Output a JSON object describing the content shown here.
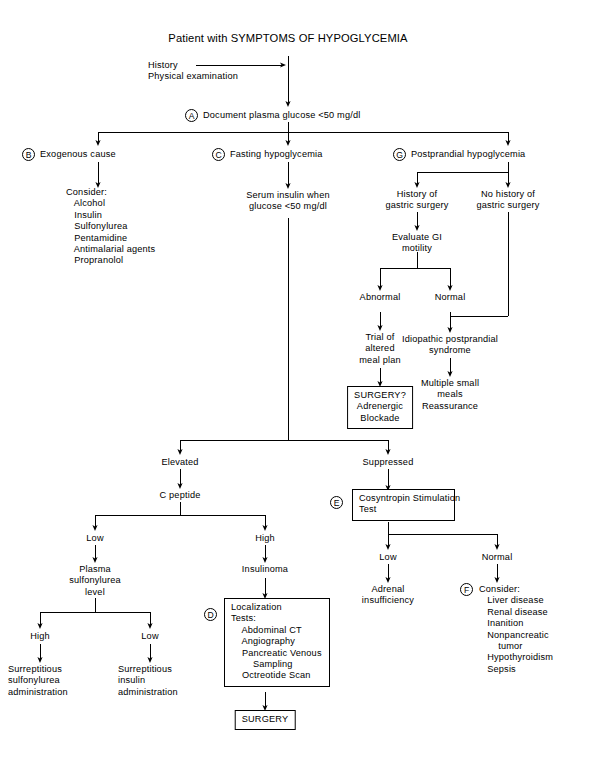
{
  "diagram": {
    "title": "Patient with SYMPTOMS OF HYPOGLYCEMIA",
    "type": "clinical-algorithm-flowchart",
    "line_color": "#000000",
    "background_color": "#ffffff"
  },
  "ref_labels": {
    "a": "A",
    "b": "B",
    "c": "C",
    "d": "D",
    "e": "E",
    "f": "F",
    "g": "G"
  },
  "nodes": {
    "history": "History\nPhysical examination",
    "document_glucose": "Document plasma glucose <50 mg/dl",
    "exogenous_cause": "Exogenous cause",
    "consider_exogenous": "Consider:\n   Alcohol\n   Insulin\n   Sulfonylurea\n   Pentamidine\n   Antimalarial agents\n   Propranolol",
    "fasting_hypoglycemia": "Fasting hypoglycemia",
    "serum_insulin": "Serum insulin when\nglucose <50 mg/dl",
    "postprandial_hypoglycemia": "Postprandial hypoglycemia",
    "history_gastric_surgery": "History of\ngastric surgery",
    "no_history_gastric_surgery": "No history of\ngastric surgery",
    "evaluate_gi_motility": "Evaluate GI\nmotility",
    "abnormal": "Abnormal",
    "normal_gi": "Normal",
    "trial_altered_meal_plan": "Trial of\naltered\nmeal plan",
    "surgery_adrenergic": "SURGERY?\nAdrenergic\nBlockade",
    "idiopathic_postprandial": "Idiopathic postprandial\nsyndrome",
    "multiple_small_meals": "Multiple small\nmeals\nReassurance",
    "elevated": "Elevated",
    "suppressed": "Suppressed",
    "c_peptide": "C peptide",
    "cosyntropin_test": "Cosyntropin Stimulation\nTest",
    "c_peptide_low": "Low",
    "c_peptide_high": "High",
    "plasma_sulfonylurea_level": "Plasma\nsulfonylurea\nlevel",
    "insulinoma": "Insulinoma",
    "localization_tests": "Localization\nTests:\n    Abdominal CT\n    Angiography\n    Pancreatic Venous\n        Sampling\n    Octreotide Scan",
    "sulfonylurea_high": "High",
    "sulfonylurea_low": "Low",
    "surreptitious_sulfonylurea": "Surreptitious\nsulfonylurea\nadministration",
    "surreptitious_insulin": "Surreptitious\ninsulin\nadministration",
    "surgery": "SURGERY",
    "cosyntropin_low": "Low",
    "cosyntropin_normal": "Normal",
    "adrenal_insufficiency": "Adrenal\ninsufficiency",
    "consider_normal": "Consider:\n   Liver disease\n   Renal disease\n   Inanition\n   Nonpancreatic\n       tumor\n   Hypothyroidism\n   Sepsis"
  }
}
